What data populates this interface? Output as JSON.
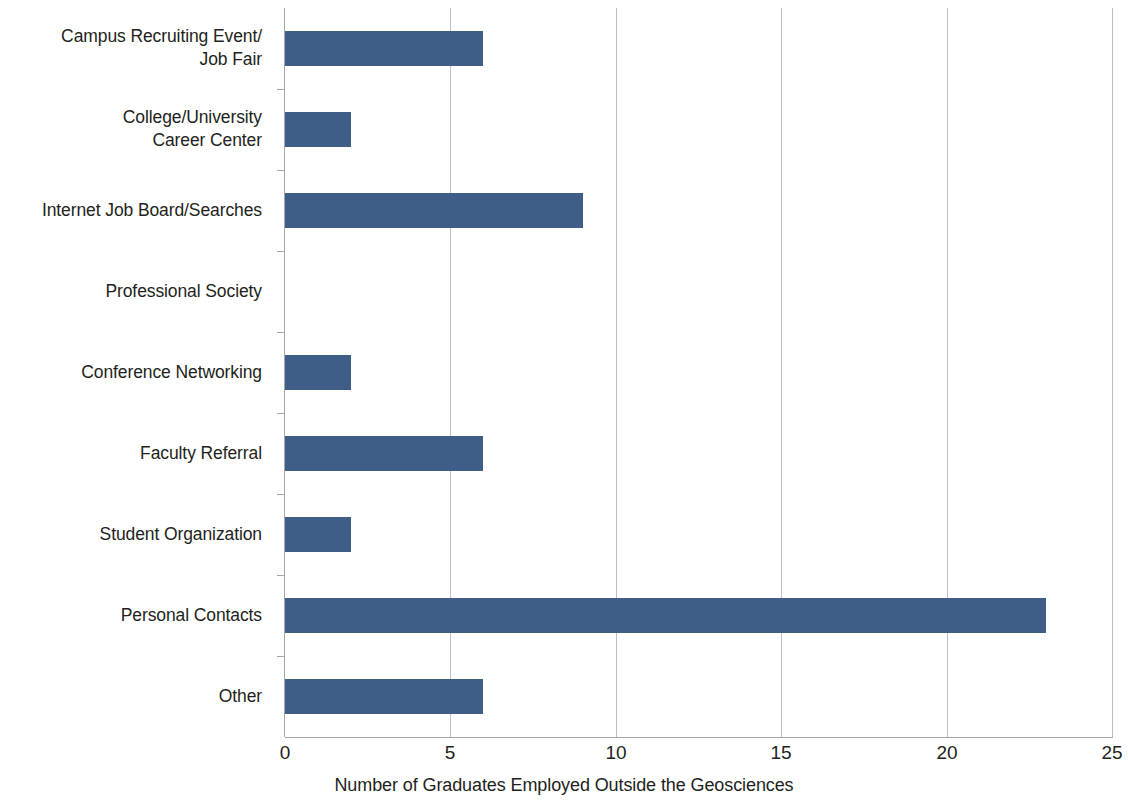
{
  "chart_data": {
    "type": "bar",
    "orientation": "horizontal",
    "title": "",
    "subtitle": "",
    "xlabel": "Number of Graduates Employed Outside the Geosciences",
    "ylabel": "",
    "categories": [
      "Campus Recruiting Event/\nJob Fair",
      "College/University\nCareer Center",
      "Internet Job Board/Searches",
      "Professional Society",
      "Conference Networking",
      "Faculty Referral",
      "Student Organization",
      "Personal Contacts",
      "Other"
    ],
    "values": [
      6,
      2,
      9,
      0,
      2,
      6,
      2,
      23,
      6
    ],
    "xlim": [
      0,
      25
    ],
    "xticks": [
      0,
      5,
      10,
      15,
      20,
      25
    ],
    "xtick_labels": [
      "0",
      "5",
      "10",
      "15",
      "20",
      "25"
    ],
    "grid": "vertical",
    "legend": "none",
    "bar_color": "#3f5e87",
    "axis_color": "#a6a6a6",
    "gridline_color": "#bfbfbf",
    "text_color": "#231f20"
  }
}
